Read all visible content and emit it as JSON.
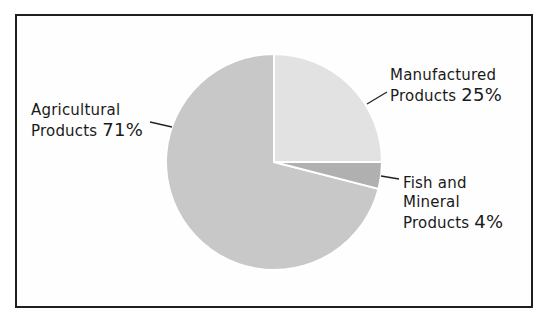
{
  "chart_data": {
    "type": "pie",
    "title": "",
    "categories": [
      "Manufactured Products",
      "Fish and Mineral Products",
      "Agricultural Products"
    ],
    "values": [
      25,
      4,
      71
    ],
    "unit": "%",
    "start_angle": "12 o'clock, clockwise",
    "colors": [
      "#e2e2e2",
      "#b0b0b0",
      "#c8c8c8"
    ],
    "legend": "none (direct labels with leader lines)",
    "labels": [
      {
        "category": "Manufactured Products",
        "line1": "Manufactured",
        "line2": "Products",
        "pct": "25%"
      },
      {
        "category": "Fish and Mineral Products",
        "line1": "Fish and",
        "line2": "Mineral",
        "line3": "Products",
        "pct": "4%"
      },
      {
        "category": "Agricultural Products",
        "line1": "Agricultural",
        "line2": "Products",
        "pct": "71%"
      }
    ]
  },
  "labels": {
    "agricultural": {
      "line1": "Agricultural",
      "line2": "Products",
      "pct": "71%"
    },
    "manufactured": {
      "line1": "Manufactured",
      "line2": "Products",
      "pct": "25%"
    },
    "fish": {
      "line1": "Fish and",
      "line2": "Mineral",
      "line3": "Products",
      "pct": "4%"
    }
  },
  "colors": {
    "frame": "#1e1e1e",
    "text": "#1a1a1a",
    "manufactured": "#e2e2e2",
    "fish": "#b0b0b0",
    "agricultural": "#c8c8c8",
    "separator": "#ffffff"
  }
}
